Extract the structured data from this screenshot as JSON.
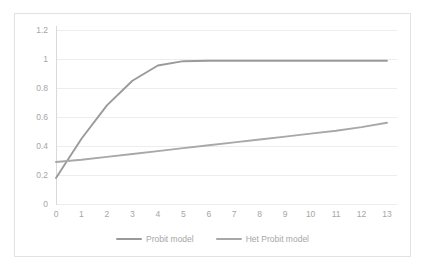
{
  "chart_data": {
    "type": "line",
    "title": "",
    "subtitle": "",
    "xlabel": "",
    "ylabel": "",
    "x": [
      0,
      1,
      2,
      3,
      4,
      5,
      6,
      7,
      8,
      9,
      10,
      11,
      12,
      13
    ],
    "categories": [
      "0",
      "1",
      "2",
      "3",
      "4",
      "5",
      "6",
      "7",
      "8",
      "9",
      "10",
      "11",
      "12",
      "13"
    ],
    "xlim": [
      0,
      13
    ],
    "ylim": [
      0,
      1.2
    ],
    "y_ticks": [
      0,
      0.2,
      0.4,
      0.6,
      0.8,
      1,
      1.2
    ],
    "y_tick_labels": [
      "0",
      "0.2",
      "0.4",
      "0.6",
      "0.8",
      "1",
      "1.2"
    ],
    "x_tick_labels": [
      "0",
      "1",
      "2",
      "3",
      "4",
      "5",
      "6",
      "7",
      "8",
      "9",
      "10",
      "11",
      "12",
      "13"
    ],
    "grid": "horizontal",
    "legend_position": "bottom-center",
    "series": [
      {
        "name": "Probit model",
        "color": "#9a9a9a",
        "values": [
          0.18,
          0.45,
          0.68,
          0.85,
          0.955,
          0.985,
          0.988,
          0.988,
          0.988,
          0.988,
          0.988,
          0.988,
          0.988,
          0.988
        ]
      },
      {
        "name": "Het Probit model",
        "color": "#a8a8a8",
        "values": [
          0.29,
          0.305,
          0.325,
          0.345,
          0.365,
          0.385,
          0.405,
          0.425,
          0.445,
          0.465,
          0.485,
          0.505,
          0.53,
          0.56
        ]
      }
    ]
  },
  "legend": {
    "items": [
      {
        "label": "Probit model"
      },
      {
        "label": "Het Probit model"
      }
    ]
  },
  "colors": {
    "background": "#ffffff",
    "frame_border": "#e2e2e2",
    "gridline": "#ededed",
    "axis": "#d9d9d9",
    "tick_text": "#a6a6a6",
    "series_1": "#9a9a9a",
    "series_2": "#a8a8a8"
  }
}
